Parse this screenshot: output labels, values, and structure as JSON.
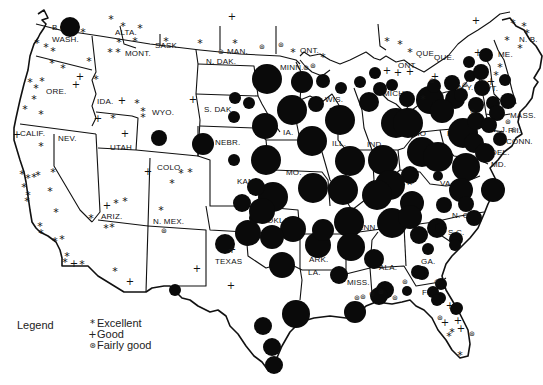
{
  "legend": {
    "title": "Legend",
    "items": [
      {
        "glyph": "*",
        "label": "Excellent",
        "icon": "asterisk-icon"
      },
      {
        "glyph": "+",
        "label": "Good",
        "icon": "plus-icon"
      },
      {
        "glyph": "⊛",
        "label": "Fairly good",
        "icon": "circled-asterisk-icon"
      }
    ]
  },
  "labels": [
    {
      "t": "B.C.",
      "x": 52,
      "y": 30
    },
    {
      "t": "WASH.",
      "x": 52,
      "y": 42
    },
    {
      "t": "ALTA.",
      "x": 115,
      "y": 35
    },
    {
      "t": "SASK.",
      "x": 155,
      "y": 48
    },
    {
      "t": "MONT.",
      "x": 125,
      "y": 56
    },
    {
      "t": "MAN.",
      "x": 227,
      "y": 54
    },
    {
      "t": "ONT.",
      "x": 300,
      "y": 53
    },
    {
      "t": "N. DAK.",
      "x": 206,
      "y": 64
    },
    {
      "t": "MINN.",
      "x": 280,
      "y": 70
    },
    {
      "t": "ORE.",
      "x": 46,
      "y": 94
    },
    {
      "t": "IDA.",
      "x": 97,
      "y": 104
    },
    {
      "t": "WYO.",
      "x": 152,
      "y": 115
    },
    {
      "t": "S. DAK.",
      "x": 204,
      "y": 112
    },
    {
      "t": "WIS.",
      "x": 325,
      "y": 102
    },
    {
      "t": "MICH.",
      "x": 383,
      "y": 96
    },
    {
      "t": "NEBR.",
      "x": 215,
      "y": 145
    },
    {
      "t": "IA.",
      "x": 283,
      "y": 135
    },
    {
      "t": "CALIF.",
      "x": 20,
      "y": 136
    },
    {
      "t": "NEV.",
      "x": 58,
      "y": 141
    },
    {
      "t": "UTAH",
      "x": 110,
      "y": 150
    },
    {
      "t": "COLO.",
      "x": 157,
      "y": 170
    },
    {
      "t": "ILL.",
      "x": 332,
      "y": 146
    },
    {
      "t": "IND.",
      "x": 367,
      "y": 147
    },
    {
      "t": "OHIO",
      "x": 405,
      "y": 136
    },
    {
      "t": "N.Y.",
      "x": 458,
      "y": 90
    },
    {
      "t": "PA.",
      "x": 447,
      "y": 136
    },
    {
      "t": "N. J.",
      "x": 490,
      "y": 132
    },
    {
      "t": "DEL.",
      "x": 491,
      "y": 155
    },
    {
      "t": "MD.",
      "x": 491,
      "y": 167
    },
    {
      "t": "W.VA.",
      "x": 423,
      "y": 166
    },
    {
      "t": "VA.",
      "x": 440,
      "y": 186
    },
    {
      "t": "MO.",
      "x": 286,
      "y": 175
    },
    {
      "t": "KANS.",
      "x": 237,
      "y": 184
    },
    {
      "t": "KY.",
      "x": 400,
      "y": 185
    },
    {
      "t": "ARIZ.",
      "x": 101,
      "y": 219
    },
    {
      "t": "N. MEX.",
      "x": 153,
      "y": 224
    },
    {
      "t": "OKLA.",
      "x": 267,
      "y": 223
    },
    {
      "t": "TENN.",
      "x": 353,
      "y": 230
    },
    {
      "t": "N. C.",
      "x": 452,
      "y": 218
    },
    {
      "t": "S.C.",
      "x": 448,
      "y": 235
    },
    {
      "t": "TEXAS",
      "x": 215,
      "y": 264
    },
    {
      "t": "ARK.",
      "x": 309,
      "y": 262
    },
    {
      "t": "LA.",
      "x": 308,
      "y": 275
    },
    {
      "t": "MISS.",
      "x": 347,
      "y": 285
    },
    {
      "t": "ALA.",
      "x": 379,
      "y": 270
    },
    {
      "t": "GA.",
      "x": 421,
      "y": 264
    },
    {
      "t": "FLA.",
      "x": 422,
      "y": 295
    },
    {
      "t": "QUE.",
      "x": 434,
      "y": 60
    },
    {
      "t": "ONT.",
      "x": 398,
      "y": 68
    },
    {
      "t": "QUE.",
      "x": 416,
      "y": 56
    },
    {
      "t": "N. B.",
      "x": 519,
      "y": 42
    },
    {
      "t": "ME.",
      "x": 498,
      "y": 57
    },
    {
      "t": "MASS.",
      "x": 510,
      "y": 118
    },
    {
      "t": "R.I.",
      "x": 508,
      "y": 133
    },
    {
      "t": "CONN.",
      "x": 506,
      "y": 144
    },
    {
      "t": "VT.",
      "x": 486,
      "y": 91
    }
  ],
  "circles": [
    {
      "x": 70,
      "y": 27,
      "r": 10
    },
    {
      "x": 267,
      "y": 79,
      "r": 15
    },
    {
      "x": 302,
      "y": 82,
      "r": 11
    },
    {
      "x": 323,
      "y": 81,
      "r": 7
    },
    {
      "x": 341,
      "y": 88,
      "r": 6
    },
    {
      "x": 360,
      "y": 82,
      "r": 6
    },
    {
      "x": 375,
      "y": 73,
      "r": 6
    },
    {
      "x": 380,
      "y": 89,
      "r": 7
    },
    {
      "x": 392,
      "y": 85,
      "r": 6
    },
    {
      "x": 369,
      "y": 102,
      "r": 10
    },
    {
      "x": 235,
      "y": 98,
      "r": 6
    },
    {
      "x": 249,
      "y": 103,
      "r": 6
    },
    {
      "x": 234,
      "y": 117,
      "r": 6
    },
    {
      "x": 292,
      "y": 110,
      "r": 15
    },
    {
      "x": 316,
      "y": 104,
      "r": 8
    },
    {
      "x": 340,
      "y": 120,
      "r": 15
    },
    {
      "x": 265,
      "y": 126,
      "r": 13
    },
    {
      "x": 312,
      "y": 141,
      "r": 15
    },
    {
      "x": 159,
      "y": 138,
      "r": 8
    },
    {
      "x": 203,
      "y": 144,
      "r": 11
    },
    {
      "x": 234,
      "y": 160,
      "r": 6
    },
    {
      "x": 266,
      "y": 160,
      "r": 15
    },
    {
      "x": 350,
      "y": 161,
      "r": 15
    },
    {
      "x": 383,
      "y": 160,
      "r": 15
    },
    {
      "x": 422,
      "y": 152,
      "r": 15
    },
    {
      "x": 396,
      "y": 123,
      "r": 15
    },
    {
      "x": 430,
      "y": 100,
      "r": 14
    },
    {
      "x": 455,
      "y": 99,
      "r": 10
    },
    {
      "x": 434,
      "y": 86,
      "r": 7
    },
    {
      "x": 407,
      "y": 99,
      "r": 8
    },
    {
      "x": 408,
      "y": 123,
      "r": 15
    },
    {
      "x": 463,
      "y": 133,
      "r": 15
    },
    {
      "x": 442,
      "y": 111,
      "r": 12
    },
    {
      "x": 452,
      "y": 83,
      "r": 8
    },
    {
      "x": 461,
      "y": 95,
      "r": 7
    },
    {
      "x": 470,
      "y": 76,
      "r": 6
    },
    {
      "x": 481,
      "y": 72,
      "r": 8
    },
    {
      "x": 486,
      "y": 55,
      "r": 7
    },
    {
      "x": 482,
      "y": 88,
      "r": 8
    },
    {
      "x": 476,
      "y": 105,
      "r": 8
    },
    {
      "x": 469,
      "y": 62,
      "r": 6
    },
    {
      "x": 493,
      "y": 103,
      "r": 7
    },
    {
      "x": 476,
      "y": 121,
      "r": 9
    },
    {
      "x": 505,
      "y": 80,
      "r": 6
    },
    {
      "x": 508,
      "y": 101,
      "r": 8
    },
    {
      "x": 497,
      "y": 113,
      "r": 8
    },
    {
      "x": 489,
      "y": 125,
      "r": 8
    },
    {
      "x": 500,
      "y": 139,
      "r": 7
    },
    {
      "x": 474,
      "y": 143,
      "r": 10
    },
    {
      "x": 485,
      "y": 153,
      "r": 10
    },
    {
      "x": 466,
      "y": 167,
      "r": 14
    },
    {
      "x": 438,
      "y": 157,
      "r": 15
    },
    {
      "x": 410,
      "y": 175,
      "r": 9
    },
    {
      "x": 438,
      "y": 176,
      "r": 5
    },
    {
      "x": 493,
      "y": 190,
      "r": 12
    },
    {
      "x": 461,
      "y": 190,
      "r": 12
    },
    {
      "x": 444,
      "y": 205,
      "r": 8
    },
    {
      "x": 466,
      "y": 204,
      "r": 8
    },
    {
      "x": 474,
      "y": 218,
      "r": 8
    },
    {
      "x": 412,
      "y": 203,
      "r": 12
    },
    {
      "x": 390,
      "y": 185,
      "r": 15
    },
    {
      "x": 343,
      "y": 190,
      "r": 15
    },
    {
      "x": 273,
      "y": 197,
      "r": 15
    },
    {
      "x": 313,
      "y": 188,
      "r": 15
    },
    {
      "x": 256,
      "y": 187,
      "r": 9
    },
    {
      "x": 377,
      "y": 195,
      "r": 15
    },
    {
      "x": 349,
      "y": 222,
      "r": 15
    },
    {
      "x": 392,
      "y": 223,
      "r": 15
    },
    {
      "x": 410,
      "y": 217,
      "r": 12
    },
    {
      "x": 419,
      "y": 235,
      "r": 9
    },
    {
      "x": 437,
      "y": 228,
      "r": 10
    },
    {
      "x": 456,
      "y": 239,
      "r": 7
    },
    {
      "x": 440,
      "y": 228,
      "r": 5
    },
    {
      "x": 318,
      "y": 245,
      "r": 13
    },
    {
      "x": 351,
      "y": 247,
      "r": 14
    },
    {
      "x": 374,
      "y": 259,
      "r": 10
    },
    {
      "x": 323,
      "y": 230,
      "r": 11
    },
    {
      "x": 293,
      "y": 229,
      "r": 13
    },
    {
      "x": 272,
      "y": 237,
      "r": 12
    },
    {
      "x": 282,
      "y": 265,
      "r": 13
    },
    {
      "x": 248,
      "y": 233,
      "r": 13
    },
    {
      "x": 255,
      "y": 218,
      "r": 6
    },
    {
      "x": 225,
      "y": 244,
      "r": 10
    },
    {
      "x": 242,
      "y": 203,
      "r": 9
    },
    {
      "x": 262,
      "y": 211,
      "r": 13
    },
    {
      "x": 339,
      "y": 275,
      "r": 9
    },
    {
      "x": 385,
      "y": 290,
      "r": 9
    },
    {
      "x": 422,
      "y": 273,
      "r": 7
    },
    {
      "x": 428,
      "y": 249,
      "r": 6
    },
    {
      "x": 418,
      "y": 272,
      "r": 7
    },
    {
      "x": 441,
      "y": 284,
      "r": 6
    },
    {
      "x": 455,
      "y": 245,
      "r": 6
    },
    {
      "x": 433,
      "y": 292,
      "r": 6
    },
    {
      "x": 407,
      "y": 291,
      "r": 5
    },
    {
      "x": 456,
      "y": 309,
      "r": 6
    },
    {
      "x": 440,
      "y": 298,
      "r": 6
    },
    {
      "x": 175,
      "y": 290,
      "r": 6
    },
    {
      "x": 296,
      "y": 314,
      "r": 14
    },
    {
      "x": 263,
      "y": 326,
      "r": 9
    },
    {
      "x": 272,
      "y": 347,
      "r": 9
    },
    {
      "x": 274,
      "y": 365,
      "r": 9
    },
    {
      "x": 355,
      "y": 312,
      "r": 11
    },
    {
      "x": 379,
      "y": 296,
      "r": 9
    },
    {
      "x": 437,
      "y": 300,
      "r": 6
    },
    {
      "x": 457,
      "y": 308,
      "r": 6
    },
    {
      "x": 224,
      "y": 243,
      "r": 0
    }
  ],
  "symbols": [
    {
      "k": "e",
      "x": 83,
      "y": 32
    },
    {
      "k": "e",
      "x": 37,
      "y": 43
    },
    {
      "k": "e",
      "x": 46,
      "y": 47
    },
    {
      "k": "e",
      "x": 53,
      "y": 51
    },
    {
      "k": "e",
      "x": 89,
      "y": 61
    },
    {
      "k": "e",
      "x": 52,
      "y": 63
    },
    {
      "k": "e",
      "x": 63,
      "y": 68
    },
    {
      "k": "e",
      "x": 96,
      "y": 79
    },
    {
      "k": "e",
      "x": 111,
      "y": 19
    },
    {
      "k": "e",
      "x": 123,
      "y": 26
    },
    {
      "k": "e",
      "x": 140,
      "y": 28
    },
    {
      "k": "e",
      "x": 135,
      "y": 41
    },
    {
      "k": "e",
      "x": 119,
      "y": 42
    },
    {
      "k": "e",
      "x": 166,
      "y": 41
    },
    {
      "k": "e",
      "x": 110,
      "y": 52
    },
    {
      "k": "e",
      "x": 118,
      "y": 52
    },
    {
      "k": "e",
      "x": 30,
      "y": 82
    },
    {
      "k": "e",
      "x": 36,
      "y": 88
    },
    {
      "k": "e",
      "x": 42,
      "y": 81
    },
    {
      "k": "e",
      "x": 34,
      "y": 99
    },
    {
      "k": "e",
      "x": 25,
      "y": 109
    },
    {
      "k": "e",
      "x": 41,
      "y": 114
    },
    {
      "k": "e",
      "x": 113,
      "y": 118
    },
    {
      "k": "e",
      "x": 137,
      "y": 103
    },
    {
      "k": "e",
      "x": 143,
      "y": 111
    },
    {
      "k": "e",
      "x": 143,
      "y": 117
    },
    {
      "k": "e",
      "x": 200,
      "y": 43
    },
    {
      "k": "e",
      "x": 235,
      "y": 43
    },
    {
      "k": "e",
      "x": 293,
      "y": 52
    },
    {
      "k": "e",
      "x": 323,
      "y": 57
    },
    {
      "k": "e",
      "x": 41,
      "y": 146
    },
    {
      "k": "e",
      "x": 53,
      "y": 172
    },
    {
      "k": "e",
      "x": 22,
      "y": 174
    },
    {
      "k": "e",
      "x": 28,
      "y": 178
    },
    {
      "k": "e",
      "x": 34,
      "y": 177
    },
    {
      "k": "e",
      "x": 38,
      "y": 175
    },
    {
      "k": "e",
      "x": 24,
      "y": 187
    },
    {
      "k": "e",
      "x": 28,
      "y": 195
    },
    {
      "k": "e",
      "x": 50,
      "y": 191
    },
    {
      "k": "e",
      "x": 27,
      "y": 201
    },
    {
      "k": "e",
      "x": 56,
      "y": 212
    },
    {
      "k": "e",
      "x": 40,
      "y": 226
    },
    {
      "k": "e",
      "x": 41,
      "y": 233
    },
    {
      "k": "e",
      "x": 55,
      "y": 241
    },
    {
      "k": "e",
      "x": 62,
      "y": 239
    },
    {
      "k": "e",
      "x": 67,
      "y": 256
    },
    {
      "k": "e",
      "x": 65,
      "y": 262
    },
    {
      "k": "e",
      "x": 82,
      "y": 264
    },
    {
      "k": "e",
      "x": 91,
      "y": 218
    },
    {
      "k": "e",
      "x": 116,
      "y": 203
    },
    {
      "k": "e",
      "x": 125,
      "y": 201
    },
    {
      "k": "e",
      "x": 106,
      "y": 228
    },
    {
      "k": "e",
      "x": 112,
      "y": 227
    },
    {
      "k": "e",
      "x": 115,
      "y": 271
    },
    {
      "k": "e",
      "x": 181,
      "y": 173
    },
    {
      "k": "e",
      "x": 190,
      "y": 172
    },
    {
      "k": "e",
      "x": 172,
      "y": 183
    },
    {
      "k": "e",
      "x": 161,
      "y": 210
    },
    {
      "k": "e",
      "x": 387,
      "y": 41
    },
    {
      "k": "e",
      "x": 400,
      "y": 44
    },
    {
      "k": "e",
      "x": 410,
      "y": 52
    },
    {
      "k": "e",
      "x": 423,
      "y": 99
    },
    {
      "k": "e",
      "x": 513,
      "y": 23
    },
    {
      "k": "e",
      "x": 524,
      "y": 26
    },
    {
      "k": "e",
      "x": 527,
      "y": 33
    },
    {
      "k": "e",
      "x": 520,
      "y": 48
    },
    {
      "k": "e",
      "x": 507,
      "y": 40
    },
    {
      "k": "e",
      "x": 500,
      "y": 67
    },
    {
      "k": "e",
      "x": 496,
      "y": 75
    },
    {
      "k": "e",
      "x": 449,
      "y": 336
    },
    {
      "k": "e",
      "x": 452,
      "y": 332
    },
    {
      "k": "e",
      "x": 460,
      "y": 355
    },
    {
      "k": "p",
      "x": 232,
      "y": 16
    },
    {
      "k": "p",
      "x": 80,
      "y": 76
    },
    {
      "k": "p",
      "x": 76,
      "y": 84
    },
    {
      "k": "p",
      "x": 98,
      "y": 118
    },
    {
      "k": "p",
      "x": 125,
      "y": 133
    },
    {
      "k": "p",
      "x": 17,
      "y": 134
    },
    {
      "k": "p",
      "x": 148,
      "y": 171
    },
    {
      "k": "p",
      "x": 107,
      "y": 205
    },
    {
      "k": "p",
      "x": 130,
      "y": 281
    },
    {
      "k": "p",
      "x": 197,
      "y": 268
    },
    {
      "k": "p",
      "x": 231,
      "y": 285
    },
    {
      "k": "p",
      "x": 232,
      "y": 249
    },
    {
      "k": "p",
      "x": 74,
      "y": 263
    },
    {
      "k": "p",
      "x": 122,
      "y": 100
    },
    {
      "k": "p",
      "x": 193,
      "y": 99
    },
    {
      "k": "p",
      "x": 387,
      "y": 70
    },
    {
      "k": "p",
      "x": 398,
      "y": 72
    },
    {
      "k": "p",
      "x": 410,
      "y": 71
    },
    {
      "k": "p",
      "x": 476,
      "y": 20
    },
    {
      "k": "p",
      "x": 478,
      "y": 52
    },
    {
      "k": "p",
      "x": 491,
      "y": 81
    },
    {
      "k": "p",
      "x": 435,
      "y": 76
    },
    {
      "k": "p",
      "x": 450,
      "y": 305
    },
    {
      "k": "p",
      "x": 445,
      "y": 322
    },
    {
      "k": "p",
      "x": 458,
      "y": 320
    },
    {
      "k": "p",
      "x": 461,
      "y": 328
    },
    {
      "k": "f",
      "x": 221,
      "y": 52
    },
    {
      "k": "f",
      "x": 262,
      "y": 47
    },
    {
      "k": "f",
      "x": 281,
      "y": 45
    },
    {
      "k": "f",
      "x": 306,
      "y": 68
    },
    {
      "k": "f",
      "x": 313,
      "y": 66
    },
    {
      "k": "f",
      "x": 164,
      "y": 231
    },
    {
      "k": "f",
      "x": 432,
      "y": 81
    },
    {
      "k": "f",
      "x": 465,
      "y": 85
    },
    {
      "k": "f",
      "x": 473,
      "y": 112
    },
    {
      "k": "f",
      "x": 508,
      "y": 122
    },
    {
      "k": "f",
      "x": 514,
      "y": 130
    },
    {
      "k": "f",
      "x": 357,
      "y": 298
    },
    {
      "k": "f",
      "x": 363,
      "y": 297
    },
    {
      "k": "f",
      "x": 372,
      "y": 294
    },
    {
      "k": "f",
      "x": 381,
      "y": 292
    },
    {
      "k": "f",
      "x": 405,
      "y": 282
    },
    {
      "k": "f",
      "x": 395,
      "y": 298
    },
    {
      "k": "f",
      "x": 437,
      "y": 282
    },
    {
      "k": "f",
      "x": 440,
      "y": 318
    },
    {
      "k": "f",
      "x": 472,
      "y": 334
    }
  ]
}
